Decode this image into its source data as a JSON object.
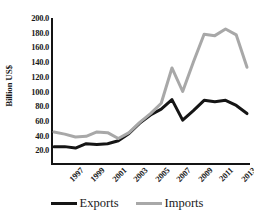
{
  "chart_data": {
    "type": "line",
    "title": "",
    "xlabel": "",
    "ylabel": "Billion US$",
    "x": [
      1997,
      1998,
      1999,
      2000,
      2001,
      2002,
      2003,
      2004,
      2005,
      2006,
      2007,
      2008,
      2009,
      2010,
      2011,
      2012,
      2013,
      2014,
      2015
    ],
    "xtick_labels": [
      "1997",
      "1999",
      "2001",
      "2003",
      "2005",
      "2007",
      "2009",
      "2011",
      "2013",
      "2015"
    ],
    "xtick_values": [
      1997,
      1999,
      2001,
      2003,
      2005,
      2007,
      2009,
      2011,
      2013,
      2015
    ],
    "ytick_labels": [
      "20.0",
      "40.0",
      "60.0",
      "80.0",
      "100.0",
      "120.0",
      "140.0",
      "160.0",
      "180.0",
      "200.0"
    ],
    "ytick_values": [
      20,
      40,
      60,
      80,
      100,
      120,
      140,
      160,
      180,
      200
    ],
    "ylim": [
      0,
      200
    ],
    "xlim": [
      1997,
      2015
    ],
    "grid": false,
    "legend_position": "bottom",
    "series": [
      {
        "name": "Exports",
        "color": "#151515",
        "values": [
          25,
          25,
          23,
          29,
          28,
          29,
          33,
          43,
          57,
          68,
          76,
          89,
          61,
          74,
          88,
          86,
          88,
          81,
          70
        ]
      },
      {
        "name": "Imports",
        "color": "#a8a8a8",
        "values": [
          45,
          42,
          38,
          39,
          45,
          44,
          36,
          44,
          58,
          70,
          84,
          132,
          100,
          140,
          178,
          176,
          185,
          177,
          133
        ]
      }
    ]
  },
  "legend": {
    "entries": [
      {
        "label": "Exports",
        "color": "#151515"
      },
      {
        "label": "Imports",
        "color": "#a8a8a8"
      }
    ]
  }
}
